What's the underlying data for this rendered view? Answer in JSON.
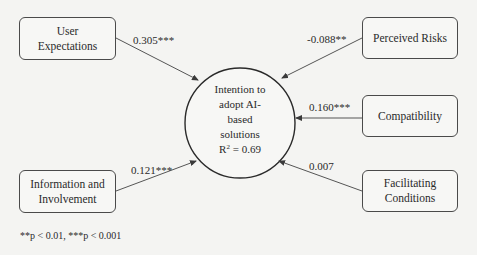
{
  "diagram": {
    "type": "path-model",
    "outcome": {
      "label_lines": [
        "Intention to",
        "adopt AI-",
        "based",
        "solutions"
      ],
      "r_squared_label": "R",
      "r_squared_sup": "2",
      "r_squared_value": " = 0.69"
    },
    "predictors": [
      {
        "id": "ue",
        "label_lines": [
          "User",
          "Expectations"
        ],
        "coefficient": "0.305***"
      },
      {
        "id": "pr",
        "label_lines": [
          "Perceived Risks"
        ],
        "coefficient": "-0.088**"
      },
      {
        "id": "co",
        "label_lines": [
          "Compatibility"
        ],
        "coefficient": "0.160***"
      },
      {
        "id": "fc",
        "label_lines": [
          "Facilitating",
          "Conditions"
        ],
        "coefficient": "0.007"
      },
      {
        "id": "ii",
        "label_lines": [
          "Information and",
          "Involvement"
        ],
        "coefficient": "0.121***"
      }
    ],
    "footnote": "**p < 0.01, ***p < 0.001"
  },
  "colors": {
    "line": "#4a4a4a",
    "background": "#f4f4f2"
  }
}
